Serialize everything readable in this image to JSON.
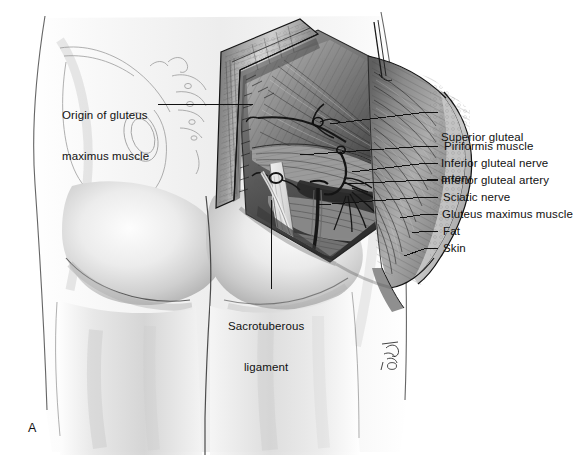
{
  "figure": {
    "panel_letter": "A",
    "background_color": "#ffffff",
    "ink_color": "#111111",
    "style": "grayscale pencil/wash medical illustration"
  },
  "labels": {
    "left": [
      {
        "id": "origin-gluteus-maximus",
        "lines": [
          "Origin of gluteus",
          "maximus muscle"
        ],
        "text": "Origin of gluteus maximus muscle",
        "x": 62,
        "y": 82,
        "leader": {
          "x1": 158,
          "y1": 104,
          "x2": 253,
          "y2": 104
        }
      }
    ],
    "bottom": [
      {
        "id": "sacrotuberous-ligament",
        "lines": [
          "Sacrotuberous",
          "ligament"
        ],
        "text": "Sacrotuberous ligament",
        "x": 228,
        "y": 293,
        "leader": {
          "x1": 271,
          "y1": 200,
          "x2": 271,
          "y2": 289
        }
      }
    ],
    "right": [
      {
        "id": "superior-gluteal-artery",
        "lines": [
          "Superior gluteal",
          "artery"
        ],
        "text": "Superior gluteal artery",
        "x": 441,
        "y": 104,
        "leader_y": 112
      },
      {
        "id": "piriformis-muscle",
        "lines": [
          "Piriformis muscle"
        ],
        "text": "Piriformis muscle",
        "x": 444,
        "y": 140,
        "leader_y": 146
      },
      {
        "id": "inferior-gluteal-nerve",
        "lines": [
          "Inferior gluteal nerve"
        ],
        "text": "Inferior gluteal nerve",
        "x": 441,
        "y": 157,
        "leader_y": 163
      },
      {
        "id": "inferior-gluteal-artery",
        "lines": [
          "Inferior gluteal artery"
        ],
        "text": "Inferior gluteal artery",
        "x": 441,
        "y": 174,
        "leader_y": 180
      },
      {
        "id": "sciatic-nerve",
        "lines": [
          "Sciatic nerve"
        ],
        "text": "Sciatic nerve",
        "x": 443,
        "y": 191,
        "leader_y": 197
      },
      {
        "id": "gluteus-maximus-muscle",
        "lines": [
          "Gluteus maximus muscle"
        ],
        "text": "Gluteus maximus muscle",
        "x": 442,
        "y": 208,
        "leader_y": 214
      },
      {
        "id": "fat",
        "lines": [
          "Fat"
        ],
        "text": "Fat",
        "x": 443,
        "y": 225,
        "leader_y": 231
      },
      {
        "id": "skin",
        "lines": [
          "Skin"
        ],
        "text": "Skin",
        "x": 443,
        "y": 242,
        "leader_y": 248
      }
    ],
    "right_leader_x1": 427,
    "right_leader_x2": 438
  }
}
